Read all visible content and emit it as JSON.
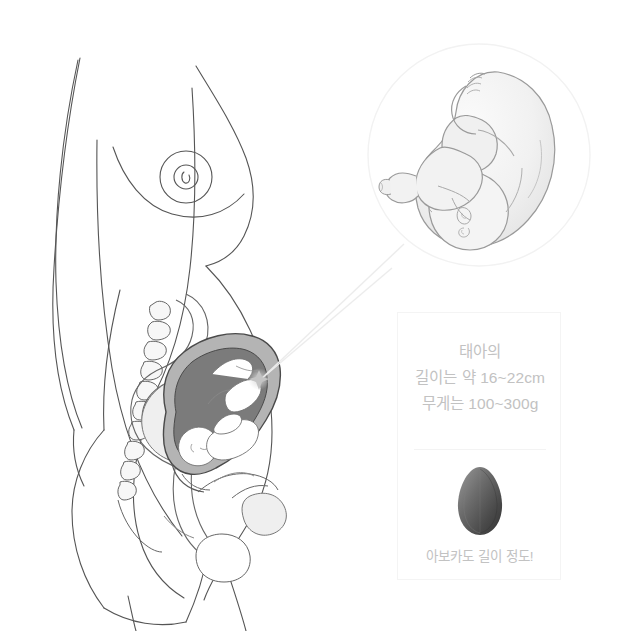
{
  "canvas": {
    "width": 632,
    "height": 631,
    "background": "#ffffff"
  },
  "illustration": {
    "title": "pregnant-woman-side-profile-cross-section",
    "description": "Line drawing of a pregnant woman in side profile with an anatomical cross-section of the abdomen showing the spine, intestines, uterus with fetus, and bladder.",
    "line_color": "#555555",
    "organ_fill_light": "#efefef",
    "organ_fill_mid": "#c9c9c9",
    "organ_fill_dark": "#8e8e8e",
    "uterus_wall_color": "#a8a8a8",
    "amniotic_fill": "#7e7e7e"
  },
  "magnifier": {
    "name": "fetus-closeup-circle",
    "border_color": "#f2f2f2",
    "fill": "#ffffff",
    "center_x": 479,
    "center_y": 155,
    "radius": 111,
    "subject": "fetus curled in fetal position",
    "subject_line_color": "#9a9a9a",
    "subject_fill": "#f2f2f2"
  },
  "connector": {
    "name": "magnifier-connector-lines",
    "color": "#ededed",
    "origin_x": 258,
    "origin_y": 380,
    "sparkle_color": "#c8c8c8"
  },
  "card": {
    "border_color": "#f4f4f4",
    "background": "#ffffff",
    "text_color": "#c2c2c2",
    "divider_color": "#f3f3f3",
    "stats": [
      "태아의",
      "길이는 약 16~22cm",
      "무게는 100~300g"
    ],
    "comparison": {
      "icon_name": "avocado-icon",
      "icon_color_light": "#8c8c8c",
      "icon_color_dark": "#3a3a3a",
      "caption": "아보카도 길이 정도!"
    }
  }
}
